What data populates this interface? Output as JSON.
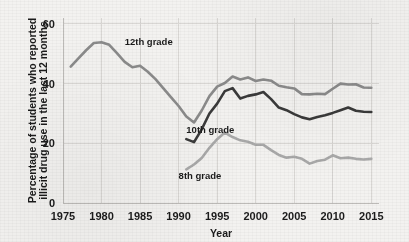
{
  "chart_data": {
    "type": "line",
    "title": "",
    "xlabel": "Year",
    "ylabel": "Percentage of students who reported illicit drug use in the last 12 months",
    "ylabel_line1": "Percentage of students who reported",
    "ylabel_line2": "illicit drug use in the last 12 months",
    "xlim": [
      1975,
      2016
    ],
    "ylim": [
      0,
      62
    ],
    "xticks": [
      1975,
      1980,
      1985,
      1990,
      1995,
      2000,
      2005,
      2010,
      2015
    ],
    "xtick_labels": [
      "1975",
      "1980",
      "1985",
      "1990",
      "1995",
      "2000",
      "2005",
      "2010",
      "2015"
    ],
    "yticks": [
      0,
      20,
      40,
      60
    ],
    "ytick_labels": [
      "0",
      "20",
      "40",
      "60"
    ],
    "grid": "both",
    "legend_position": "inline-annotations",
    "series": [
      {
        "name": "12th grade",
        "color": "#8b8b8b",
        "label_x": 1983.0,
        "label_y": 53.0,
        "x": [
          1976,
          1977,
          1978,
          1979,
          1980,
          1981,
          1982,
          1983,
          1984,
          1985,
          1986,
          1987,
          1988,
          1989,
          1990,
          1991,
          1992,
          1993,
          1994,
          1995,
          1996,
          1997,
          1998,
          1999,
          2000,
          2001,
          2002,
          2003,
          2004,
          2005,
          2006,
          2007,
          2008,
          2009,
          2010,
          2011,
          2012,
          2013,
          2014,
          2015
        ],
        "values": [
          45.7,
          48.5,
          51.2,
          53.6,
          53.9,
          53.0,
          50.2,
          47.3,
          45.5,
          46.0,
          44.0,
          41.5,
          38.5,
          35.5,
          32.5,
          29.0,
          27.0,
          31.0,
          35.8,
          39.0,
          40.2,
          42.4,
          41.4,
          42.1,
          40.9,
          41.4,
          41.0,
          39.3,
          38.8,
          38.4,
          36.5,
          36.4,
          36.6,
          36.5,
          38.3,
          40.0,
          39.7,
          39.8,
          38.7,
          38.6
        ]
      },
      {
        "name": "10th grade",
        "color": "#3a3a3a",
        "label_x": 1991.0,
        "label_y": 23.5,
        "x": [
          1991,
          1992,
          1993,
          1994,
          1995,
          1996,
          1997,
          1998,
          1999,
          2000,
          2001,
          2002,
          2003,
          2004,
          2005,
          2006,
          2007,
          2008,
          2009,
          2010,
          2011,
          2012,
          2013,
          2014,
          2015
        ],
        "values": [
          21.4,
          20.4,
          24.7,
          30.0,
          33.3,
          37.5,
          38.5,
          35.0,
          35.9,
          36.4,
          37.2,
          34.8,
          32.0,
          31.1,
          29.8,
          28.7,
          28.1,
          28.8,
          29.4,
          30.2,
          31.1,
          32.0,
          30.9,
          30.6,
          30.5
        ]
      },
      {
        "name": "8th grade",
        "color": "#a9a9a9",
        "label_x": 1990.0,
        "label_y": 8.0,
        "x": [
          1991,
          1992,
          1993,
          1994,
          1995,
          1996,
          1997,
          1998,
          1999,
          2000,
          2001,
          2002,
          2003,
          2004,
          2005,
          2006,
          2007,
          2008,
          2009,
          2010,
          2011,
          2012,
          2013,
          2014,
          2015
        ],
        "values": [
          11.3,
          12.9,
          15.1,
          18.5,
          21.4,
          23.6,
          22.1,
          21.0,
          20.5,
          19.5,
          19.5,
          17.7,
          16.1,
          15.2,
          15.5,
          14.8,
          13.2,
          14.1,
          14.5,
          16.0,
          15.0,
          15.2,
          14.8,
          14.6,
          14.8
        ]
      }
    ]
  }
}
